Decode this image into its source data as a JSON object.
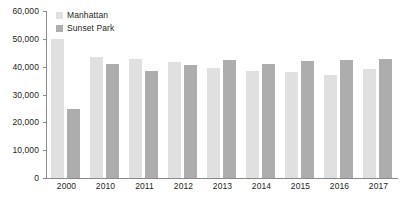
{
  "chart_data": {
    "type": "bar",
    "title": "",
    "xlabel": "",
    "ylabel": "",
    "categories": [
      "2000",
      "2010",
      "2011",
      "2012",
      "2013",
      "2014",
      "2015",
      "2016",
      "2017"
    ],
    "series": [
      {
        "name": "Manhattan",
        "color": "#e0e0e0",
        "values": [
          49800,
          43500,
          42800,
          41800,
          39500,
          38500,
          38200,
          37000,
          39000
        ]
      },
      {
        "name": "Sunset Park",
        "color": "#adadad",
        "values": [
          24800,
          41100,
          38600,
          40600,
          42400,
          41000,
          41900,
          42500,
          42700
        ]
      }
    ],
    "ylim": [
      0,
      60000
    ],
    "ytick_values": [
      60000,
      50000,
      40000,
      30000,
      20000,
      10000,
      0
    ],
    "ytick_labels": [
      "60,000",
      "50,000",
      "40,000",
      "30,000",
      "20,000",
      "10,000",
      "0"
    ],
    "grid": false,
    "legend_position": "top-left"
  }
}
